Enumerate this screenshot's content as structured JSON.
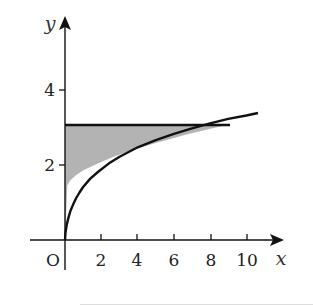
{
  "diagram": {
    "type": "shaded-region-graph",
    "curve": "y = sqrt(x)",
    "horizontal_line": "y = 3",
    "shaded_region": "between y-axis, line y = 3 and curve y = sqrt(x), for 0 <= x <= 9",
    "colors": {
      "shade": "#b3b3b3",
      "ink": "#111111"
    }
  },
  "axes": {
    "x_label": "x",
    "y_label": "y",
    "origin_label": "O",
    "x_ticks": [
      "2",
      "4",
      "6",
      "8",
      "10"
    ],
    "y_ticks": [
      "2",
      "4"
    ]
  }
}
